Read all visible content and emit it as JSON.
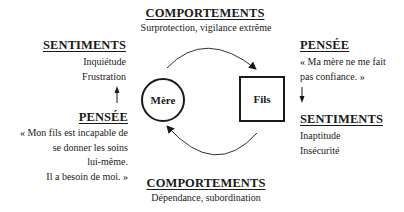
{
  "top_behavior": {
    "heading": "COMPORTEMENTS",
    "text": "Surprotection, vigilance extrême"
  },
  "bottom_behavior": {
    "heading": "COMPORTEMENTS",
    "text": "Dépendance, subordination"
  },
  "mother": {
    "label": "Mère",
    "shape": "circle",
    "feelings": {
      "heading": "SENTIMENTS",
      "lines": [
        "Inquiétude",
        "Frustration"
      ]
    },
    "thought": {
      "heading": "PENSÉE",
      "lines": [
        "« Mon fils est incapable de",
        "se donner les soins",
        "lui-même.",
        "Il a besoin de moi. »"
      ]
    },
    "arrow_direction": "up"
  },
  "son": {
    "label": "Fils",
    "shape": "square",
    "thought": {
      "heading": "PENSÉE",
      "lines": [
        "« Ma mère ne me fait",
        "pas confiance. »"
      ]
    },
    "feelings": {
      "heading": "SENTIMENTS",
      "lines": [
        "Inaptitude",
        "Insécurité"
      ]
    },
    "arrow_direction": "down"
  },
  "colors": {
    "ink": "#1a1a1a",
    "background": "#ffffff"
  }
}
